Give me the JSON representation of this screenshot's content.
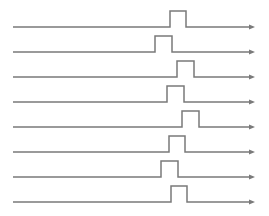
{
  "diagram": {
    "type": "timing-diagram",
    "colors": {
      "line": "#7a7a7a",
      "background": "#ffffff"
    },
    "x_start": 13,
    "x_end": 255,
    "pulse_height": 16,
    "arrow": {
      "length": 6,
      "half_width": 2.5
    },
    "signals": [
      {
        "id": 1,
        "baseline_y": 27,
        "rise_x": 170,
        "fall_x": 186
      },
      {
        "id": 2,
        "baseline_y": 52,
        "rise_x": 155,
        "fall_x": 172
      },
      {
        "id": 3,
        "baseline_y": 77,
        "rise_x": 177,
        "fall_x": 194
      },
      {
        "id": 4,
        "baseline_y": 102,
        "rise_x": 167,
        "fall_x": 184
      },
      {
        "id": 5,
        "baseline_y": 127,
        "rise_x": 182,
        "fall_x": 199
      },
      {
        "id": 6,
        "baseline_y": 152,
        "rise_x": 169,
        "fall_x": 185
      },
      {
        "id": 7,
        "baseline_y": 177,
        "rise_x": 161,
        "fall_x": 178
      },
      {
        "id": 8,
        "baseline_y": 202,
        "rise_x": 171,
        "fall_x": 187
      }
    ]
  }
}
